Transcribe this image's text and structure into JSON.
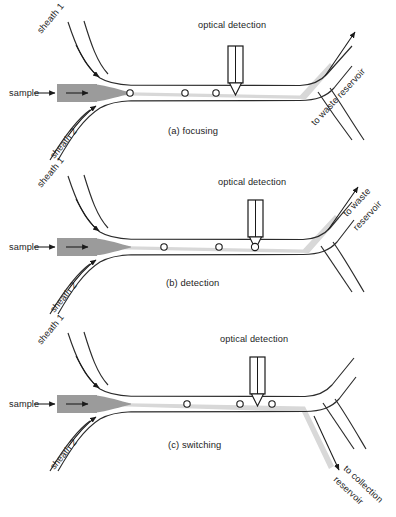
{
  "figure": {
    "panel_count": 3
  },
  "colors": {
    "wall": "#2b2b2b",
    "sample_block": "#9b9b9b",
    "focused_stream": "#d8d8d8",
    "text": "#1d1d1d",
    "background": "#ffffff"
  },
  "panels": [
    {
      "id": "a",
      "caption": "(a) focusing",
      "labels": {
        "sample": "sample",
        "sheath1": "sheath 1",
        "sheath2": "sheath 2",
        "optical_detection": "optical detection",
        "outlet": "to waste reservoir",
        "outlet_line1": "to waste reservoir",
        "outlet_line2": ""
      },
      "cells": [
        {
          "x": 130,
          "y": 93
        },
        {
          "x": 185,
          "y": 93
        },
        {
          "x": 216,
          "y": 93
        }
      ],
      "stream_exit": "up-to-waste",
      "cell_at_probe": false
    },
    {
      "id": "b",
      "caption": "(b) detection",
      "labels": {
        "sample": "sample",
        "sheath1": "sheath 1",
        "sheath2": "sheath 2",
        "optical_detection": "optical detection",
        "outlet": "to waste reservoir",
        "outlet_line1": "to waste",
        "outlet_line2": "reservoir"
      },
      "cells": [
        {
          "x": 164,
          "y": 247
        },
        {
          "x": 219,
          "y": 247
        },
        {
          "x": 255,
          "y": 247
        }
      ],
      "stream_exit": "up-to-waste",
      "cell_at_probe": true
    },
    {
      "id": "c",
      "caption": "(c) switching",
      "labels": {
        "sample": "sample",
        "sheath1": "sheath 1",
        "sheath2": "sheath 2",
        "optical_detection": "optical detection",
        "outlet": "to collection reservoir",
        "outlet_line1": "to collection",
        "outlet_line2": "reservoir"
      },
      "cells": [
        {
          "x": 187,
          "y": 404
        },
        {
          "x": 240,
          "y": 404
        },
        {
          "x": 272,
          "y": 404
        }
      ],
      "stream_exit": "down-to-collection",
      "cell_at_probe": false
    }
  ],
  "components": {
    "probe_name": "optical detection probe",
    "cell_name": "cell particle",
    "sample_inlet_name": "sample inlet channel",
    "sheath_inlet_name": "sheath flow inlet"
  }
}
